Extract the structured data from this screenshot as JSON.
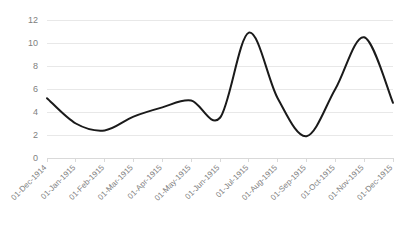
{
  "chart_data": {
    "type": "line",
    "title": "",
    "subtitle": "",
    "xlabel": "",
    "ylabel": "",
    "grid": true,
    "legend": false,
    "legend_position": "none",
    "line_color": "#1a1a1a",
    "gridline_color": "#e8e8e8",
    "axis_color": "#d9d9d9",
    "tick_label_color": "#808080",
    "background_color": "#ffffff",
    "smoothing": "spline",
    "ylim": [
      0,
      12
    ],
    "yticks": [
      0,
      2,
      4,
      6,
      8,
      10,
      12
    ],
    "ytick_labels": [
      "0",
      "2",
      "4",
      "6",
      "8",
      "10",
      "12"
    ],
    "categories": [
      "01-Dec-1914",
      "01-Jan-1915",
      "01-Feb-1915",
      "01-Mar-1915",
      "01-Apr-1915",
      "01-May-1915",
      "01-Jun-1915",
      "01-Jul-1915",
      "01-Aug-1915",
      "01-Sep-1915",
      "01-Oct-1915",
      "01-Nov-1915",
      "01-Dec-1915"
    ],
    "values": [
      5.2,
      3.0,
      2.4,
      3.6,
      4.4,
      5.0,
      3.5,
      10.9,
      5.2,
      1.9,
      6.0,
      10.5,
      4.8
    ],
    "series": [
      {
        "name": "Series 1",
        "values": [
          5.2,
          3.0,
          2.4,
          3.6,
          4.4,
          5.0,
          3.5,
          10.9,
          5.2,
          1.9,
          6.0,
          10.5,
          4.8
        ]
      }
    ]
  }
}
